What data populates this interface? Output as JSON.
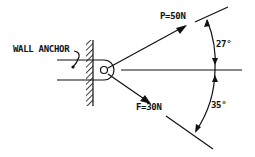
{
  "diagram": {
    "type": "force diagram",
    "labels": {
      "anchor": "WALL ANCHOR",
      "force_p": "P=50N",
      "force_f": "F=30N",
      "angle_p": "27°",
      "angle_f": "35°"
    },
    "forces": [
      {
        "name": "P",
        "magnitude_n": 50,
        "angle_deg_above_horizontal": 27
      },
      {
        "name": "F",
        "magnitude_n": 30,
        "angle_deg_below_horizontal": 35
      }
    ],
    "colors": {
      "ink": "#111111",
      "background": "#ffffff"
    }
  }
}
